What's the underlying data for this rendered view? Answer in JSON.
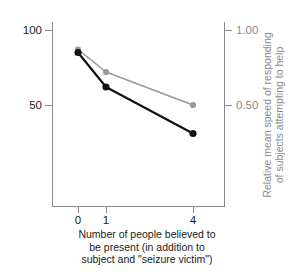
{
  "chart_data": {
    "type": "line",
    "title": "",
    "xlabel": "Number of people believed to be present (in addition to subject and \"seizure victim\")",
    "xlabel_lines": [
      "Number of people believed to",
      "be present (in addition to",
      "subject and \"seizure victim\")"
    ],
    "categories": [
      "0",
      "1",
      "4"
    ],
    "x": [
      0,
      1,
      4
    ],
    "grid": false,
    "legend": "none",
    "axes": {
      "left": {
        "label": "Percentage of subjects attempting to help",
        "ticks": [
          "100",
          "50"
        ],
        "tick_values": [
          100,
          50
        ],
        "lim": [
          8,
          111
        ],
        "color": "#1a1a1a"
      },
      "right": {
        "label": "Relative mean speed of responding of subjects attempting to help",
        "label_lines": [
          "Relative mean speed of responding",
          "of subjects attempting to help"
        ],
        "ticks": [
          "1.00",
          "0.50"
        ],
        "tick_values": [
          1.0,
          0.5
        ],
        "lim": [
          0.08,
          1.11
        ],
        "color": "#8a8a8a"
      },
      "x": {
        "ticks": [
          "0",
          "1",
          "4"
        ],
        "tick_values": [
          0,
          1,
          4
        ]
      }
    },
    "series": [
      {
        "name": "Percentage of subjects attempting to help",
        "axis": "left",
        "color": "#111111",
        "marker": "circle",
        "values": [
          85,
          62,
          31
        ]
      },
      {
        "name": "Relative mean speed of responding of subjects attempting to help",
        "axis": "right",
        "color": "#999999",
        "marker": "circle",
        "values": [
          0.87,
          0.72,
          0.5
        ]
      }
    ]
  },
  "colors": {
    "black_series": "#111111",
    "gray_series": "#999999",
    "axis": "#8a8a8a",
    "text": "#1a1a1a",
    "background": "#ffffff"
  }
}
